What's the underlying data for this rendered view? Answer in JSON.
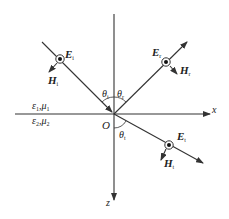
{
  "diagram": {
    "type": "plane-wave-reflection-refraction",
    "colors": {
      "line": "#333333",
      "text": "#222222",
      "background": "#ffffff"
    },
    "axes": {
      "x_label": "x",
      "z_label": "z",
      "origin_label": "O"
    },
    "media": {
      "upper": {
        "eps": "ε",
        "eps_sub": "1",
        "mu": "μ",
        "mu_sub": "1",
        "sep": ","
      },
      "lower": {
        "eps": "ε",
        "eps_sub": "2",
        "mu": "μ",
        "mu_sub": "2",
        "sep": ","
      }
    },
    "waves": {
      "incident": {
        "E": "E",
        "E_sub": "i",
        "H": "H",
        "H_sub": "i",
        "angle": "θ",
        "angle_sub": "i"
      },
      "reflected": {
        "E": "E",
        "E_sub": "r",
        "H": "H",
        "H_sub": "r",
        "angle": "θ",
        "angle_sub": "r"
      },
      "transmitted": {
        "E": "E",
        "E_sub": "t",
        "H": "H",
        "H_sub": "t",
        "angle": "θ",
        "angle_sub": "t"
      }
    }
  }
}
